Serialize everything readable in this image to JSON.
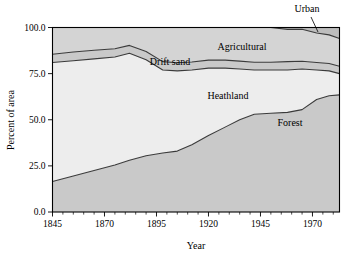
{
  "chart_data": {
    "type": "area",
    "title": "",
    "subtitle": "",
    "xlabel": "Year",
    "ylabel": "Percent of area",
    "stacked": true,
    "grid": false,
    "legend_position": "inline-annotations",
    "xlim": [
      1845,
      1983
    ],
    "ylim": [
      0.0,
      100.0
    ],
    "xticks": [
      1845,
      1870,
      1895,
      1920,
      1945,
      1970
    ],
    "xtick_labels": [
      "1845",
      "1870",
      "1895",
      "1920",
      "1945",
      "1970"
    ],
    "yticks": [
      0.0,
      25.0,
      50.0,
      75.0,
      100.0
    ],
    "ytick_labels": [
      "0.0",
      "25.0",
      "50.0",
      "75.0",
      "100.0"
    ],
    "x": [
      1845,
      1855,
      1865,
      1875,
      1882,
      1890,
      1898,
      1905,
      1912,
      1920,
      1928,
      1935,
      1942,
      1950,
      1958,
      1965,
      1972,
      1978,
      1983
    ],
    "series": [
      {
        "name": "Forest",
        "label": "Forest",
        "color": "#c9c9c9",
        "values": [
          16.5,
          19.5,
          22.5,
          25.5,
          28.0,
          30.5,
          32.0,
          33.0,
          36.5,
          41.5,
          46.0,
          50.0,
          53.0,
          53.5,
          54.0,
          55.5,
          61.0,
          63.0,
          63.5
        ]
      },
      {
        "name": "Heathland",
        "label": "Heathland",
        "color": "#ededed",
        "values": [
          64.5,
          62.5,
          60.5,
          58.5,
          58.0,
          52.0,
          45.0,
          43.5,
          40.5,
          36.5,
          32.0,
          27.5,
          24.0,
          23.5,
          23.0,
          22.0,
          16.0,
          13.5,
          11.5
        ]
      },
      {
        "name": "Drift sand",
        "label": "Drift sand",
        "color": "#c9c9c9",
        "values": [
          4.5,
          4.7,
          4.7,
          4.5,
          4.3,
          4.5,
          4.5,
          4.4,
          4.3,
          4.3,
          4.3,
          4.3,
          4.2,
          4.2,
          4.5,
          4.2,
          4.0,
          4.0,
          4.0
        ]
      },
      {
        "name": "Agricultural",
        "label": "Agricultural",
        "color": "#d4d4d4",
        "values": [
          14.5,
          13.3,
          12.3,
          11.5,
          9.7,
          13.0,
          18.5,
          19.1,
          18.7,
          17.7,
          17.7,
          18.2,
          18.8,
          18.8,
          17.5,
          17.3,
          16.0,
          15.5,
          15.0
        ]
      },
      {
        "name": "Urban",
        "label": "Urban",
        "color": "#bdbdbd",
        "values": [
          0.0,
          0.0,
          0.0,
          0.0,
          0.0,
          0.0,
          0.0,
          0.0,
          0.0,
          0.0,
          0.0,
          0.0,
          0.0,
          0.0,
          1.0,
          1.0,
          3.0,
          4.0,
          6.0
        ]
      }
    ],
    "annotations": [
      {
        "name": "urban-label",
        "text": "Urban",
        "x": 307,
        "y": 12,
        "leader": true
      },
      {
        "name": "agricultural-label",
        "text": "Agricultural",
        "x": 242,
        "y": 50,
        "leader": false
      },
      {
        "name": "drift-sand-label",
        "text": "Drift sand",
        "x": 170,
        "y": 65,
        "leader": false
      },
      {
        "name": "heathland-label",
        "text": "Heathland",
        "x": 228,
        "y": 99,
        "leader": false
      },
      {
        "name": "forest-label",
        "text": "Forest",
        "x": 290,
        "y": 126,
        "leader": false
      }
    ]
  }
}
